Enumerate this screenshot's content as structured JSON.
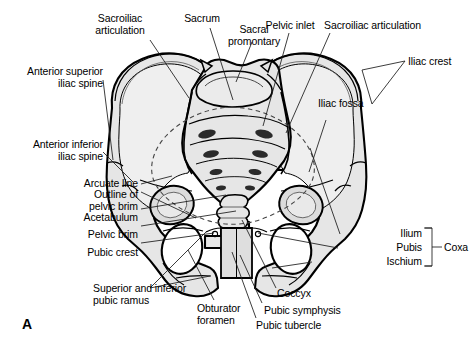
{
  "figure": {
    "panel_letter": "A",
    "colors": {
      "background": "#ffffff",
      "bone_fill": "#e6e6e6",
      "bone_fill_light": "#f1f1f1",
      "bone_fill_dark": "#d4d4d4",
      "outline": "#000000",
      "leader_line": "#1a1a1a",
      "text": "#000000"
    }
  },
  "labels": {
    "sacroiliac_articulation_left": "Sacroiliac\narticulation",
    "sacrum": "Sacrum",
    "sacral_promontory": "Sacral\npromontary",
    "pelvic_inlet": "Pelvic inlet",
    "sacroiliac_articulation_right": "Sacroiliac articulation",
    "iliac_crest": "Iliac crest",
    "anterior_superior_iliac_spine": "Anterior superior\niliac spine",
    "anterior_inferior_iliac_spine": "Anterior inferior\niliac spine",
    "iliac_fossa": "Iliac fossa",
    "arcuate_line": "Arcuate line",
    "outline_of_pelvic_brim": "Outline of\npelvic brim",
    "acetabulum": "Acetabulum",
    "pelvic_brim": "Pelvic brim",
    "pubic_crest": "Pubic crest",
    "superior_and_inferior_pubic_ramus": "Superior and inferior\npubic ramus",
    "obturator_foramen": "Obturator\nforamen",
    "pubic_tubercle": "Pubic tubercle",
    "pubic_symphysis": "Pubic symphysis",
    "coccyx": "Coccyx",
    "ilium": "Ilium",
    "pubis": "Pubis",
    "ischium": "Ischium",
    "coxa": "Coxa"
  }
}
